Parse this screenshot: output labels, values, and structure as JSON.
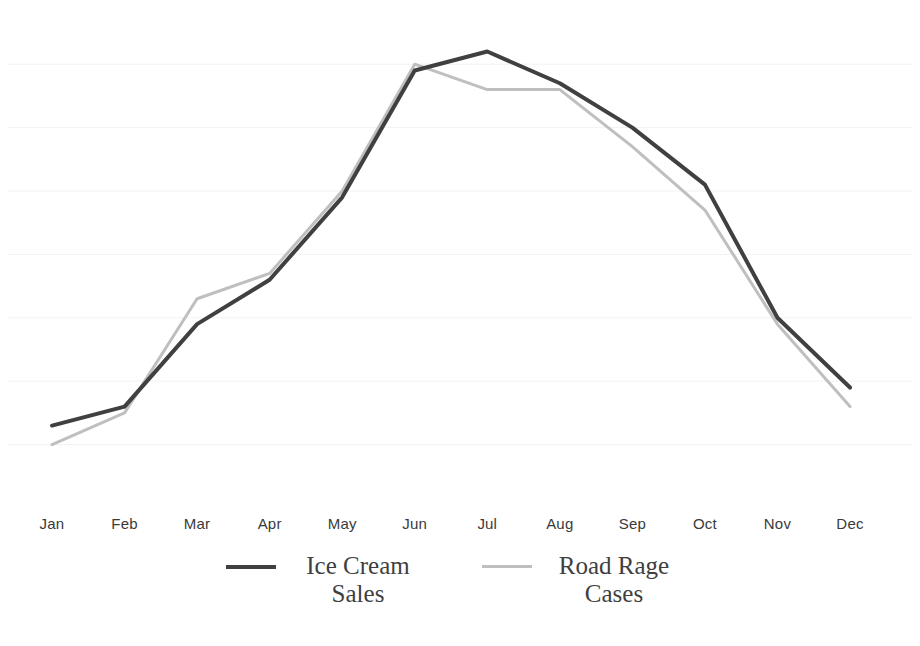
{
  "chart_data": {
    "type": "line",
    "title": "",
    "subtitle": "",
    "xlabel": "",
    "ylabel": "",
    "categories": [
      "Jan",
      "Feb",
      "Mar",
      "Apr",
      "May",
      "Jun",
      "Jul",
      "Aug",
      "Sep",
      "Oct",
      "Nov",
      "Dec"
    ],
    "series": [
      {
        "name": "Ice Cream Sales",
        "color": "#404040",
        "line_width": 4,
        "values": [
          1.3,
          1.6,
          2.9,
          3.6,
          4.9,
          6.9,
          7.2,
          6.7,
          6.0,
          5.1,
          3.0,
          1.9
        ]
      },
      {
        "name": "Road Rage Cases",
        "color": "#bfbfbf",
        "line_width": 3,
        "values": [
          1.0,
          1.5,
          3.3,
          3.7,
          5.0,
          7.0,
          6.6,
          6.6,
          5.7,
          4.7,
          2.9,
          1.6
        ]
      }
    ],
    "ylim": [
      0,
      8
    ],
    "xlim_px": [
      52,
      850
    ],
    "y_gridlines": [
      1,
      2,
      3,
      4,
      5,
      6,
      7
    ],
    "y_axis_labels_visible": false,
    "grid": true,
    "legend_position": "bottom",
    "legend_entries": [
      {
        "label_line1": "Ice Cream",
        "label_line2": "Sales",
        "color": "#404040"
      },
      {
        "label_line1": "Road Rage",
        "label_line2": "Cases",
        "color": "#bfbfbf"
      }
    ]
  },
  "colors": {
    "background": "#ffffff",
    "gridline": "#f2f2f2",
    "tick_label": "#3a3a3a",
    "legend_text": "#3f3f3f",
    "series_ice_cream": "#404040",
    "series_road_rage": "#bfbfbf"
  }
}
